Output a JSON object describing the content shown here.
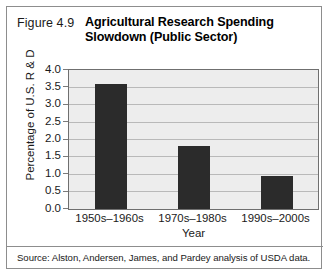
{
  "figure": {
    "number": "Figure 4.9",
    "title_line1": "Agricultural Research Spending",
    "title_line2": "Slowdown (Public Sector)",
    "source": "Source: Alston, Andersen, James, and Pardey analysis of USDA data."
  },
  "colors": {
    "bar": "#2b2b2b",
    "plot_background": "#ededed",
    "gridline": "#b9b9b9",
    "frame": "#6f6f6f",
    "panel_border": "#8d8d8d",
    "text": "#1a1a1a"
  },
  "chart_data": {
    "type": "bar",
    "title": "Agricultural Research Spending Slowdown (Public Sector)",
    "categories": [
      "1950s–1960s",
      "1970s–1980s",
      "1990s–2000s"
    ],
    "values": [
      3.6,
      1.8,
      0.95
    ],
    "xlabel": "Year",
    "ylabel": "Percentage of U.S. R & D",
    "ylim": [
      0.0,
      4.0
    ],
    "ytick_labels": [
      "4.0",
      "3.5",
      "3.0",
      "2.5",
      "2.0",
      "1.5",
      "1.0",
      "0.5",
      "0.0"
    ],
    "ytick_values": [
      4.0,
      3.5,
      3.0,
      2.5,
      2.0,
      1.5,
      1.0,
      0.5,
      0.0
    ],
    "grid": true,
    "legend": "none",
    "source": "Source: Alston, Andersen, James, and Pardey analysis of USDA data."
  }
}
